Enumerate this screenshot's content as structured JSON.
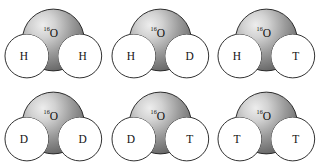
{
  "figure": {
    "background_color": "#ffffff",
    "columns": 3,
    "rows": 2
  },
  "style": {
    "oxygen_highlight_color": "#ededed",
    "oxygen_mid_color": "#9a9a9a",
    "oxygen_edge_color": "#4a4a4a",
    "hydrogen_fill_color": "#ffffff",
    "outline_color": "#1a1a1a",
    "label_color": "#111111"
  },
  "molecules": [
    {
      "id": "molecule-1",
      "name": "water-h-h",
      "oxygen": {
        "mass_number": "16",
        "symbol": "O"
      },
      "left_atom": "H",
      "right_atom": "H"
    },
    {
      "id": "molecule-2",
      "name": "water-h-d",
      "oxygen": {
        "mass_number": "16",
        "symbol": "O"
      },
      "left_atom": "H",
      "right_atom": "D"
    },
    {
      "id": "molecule-3",
      "name": "water-h-t",
      "oxygen": {
        "mass_number": "16",
        "symbol": "O"
      },
      "left_atom": "H",
      "right_atom": "T"
    },
    {
      "id": "molecule-4",
      "name": "water-d-d",
      "oxygen": {
        "mass_number": "16",
        "symbol": "O"
      },
      "left_atom": "D",
      "right_atom": "D"
    },
    {
      "id": "molecule-5",
      "name": "water-d-t",
      "oxygen": {
        "mass_number": "16",
        "symbol": "O"
      },
      "left_atom": "D",
      "right_atom": "T"
    },
    {
      "id": "molecule-6",
      "name": "water-t-t",
      "oxygen": {
        "mass_number": "16",
        "symbol": "O"
      },
      "left_atom": "T",
      "right_atom": "T"
    }
  ]
}
